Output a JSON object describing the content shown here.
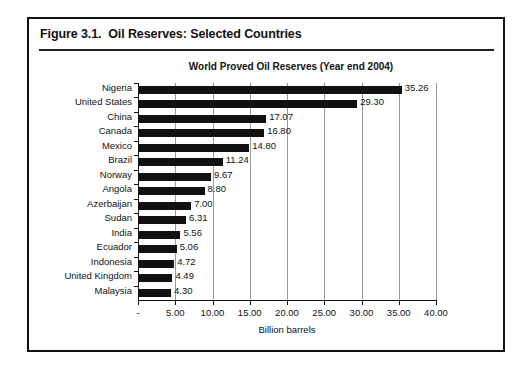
{
  "figure": {
    "caption": "Figure 3.1.  Oil Reserves: Selected Countries"
  },
  "chart_data": {
    "type": "bar",
    "orientation": "horizontal",
    "title": "World Proved Oil Reserves (Year end 2004)",
    "xlabel": "Billion barrels",
    "ylabel": "",
    "xlim": [
      0,
      40
    ],
    "grid": true,
    "legend": false,
    "categories": [
      "Nigeria",
      "United States",
      "China",
      "Canada",
      "Mexico",
      "Brazil",
      "Norway",
      "Angola",
      "Azerbaijan",
      "Sudan",
      "India",
      "Ecuador",
      "Indonesia",
      "United Kingdom",
      "Malaysia"
    ],
    "values": [
      35.26,
      29.3,
      17.07,
      16.8,
      14.8,
      11.24,
      9.67,
      8.8,
      7.0,
      6.31,
      5.56,
      5.06,
      4.72,
      4.49,
      4.3
    ],
    "value_labels": [
      "35.26",
      "29.30",
      "17.07",
      "16.80",
      "14.80",
      "11.24",
      "9.67",
      "8.80",
      "7.00",
      "6.31",
      "5.56",
      "5.06",
      "4.72",
      "4.49",
      "4.30"
    ],
    "xticks": [
      0,
      5,
      10,
      15,
      20,
      25,
      30,
      35,
      40
    ],
    "xtick_labels": [
      "-",
      "5.00",
      "10.00",
      "15.00",
      "20.00",
      "25.00",
      "30.00",
      "35.00",
      "40.00"
    ],
    "bar_color": "#111111",
    "grid_color": "#9a9a9a"
  }
}
